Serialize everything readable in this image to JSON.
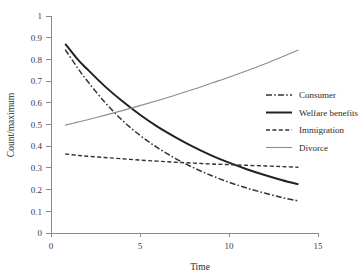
{
  "chart_data": {
    "type": "line",
    "title": "",
    "xlabel": "Time",
    "ylabel": "Count/maximum",
    "xlim": [
      0,
      15
    ],
    "ylim": [
      0,
      1
    ],
    "xticks": [
      "0",
      "5",
      "10",
      "15"
    ],
    "xtick_values": [
      0,
      5,
      10,
      15
    ],
    "yticks": [
      "0",
      "0.1",
      "0.2",
      "0.3",
      "0.4",
      "0.5",
      "0.6",
      "0.7",
      "0.8",
      "0.9",
      "1"
    ],
    "ytick_values": [
      0,
      0.1,
      0.2,
      0.3,
      0.4,
      0.5,
      0.6,
      0.7,
      0.8,
      0.9,
      1
    ],
    "grid": false,
    "legend_position": "right-upper",
    "x": [
      0.8,
      1.5,
      2,
      3,
      4,
      5,
      6,
      7,
      8,
      9,
      10,
      11,
      12,
      13,
      13.9
    ],
    "series": [
      {
        "name": "Consumer",
        "style": "dash-dot",
        "color": "#333333",
        "values": [
          0.845,
          0.76,
          0.705,
          0.605,
          0.52,
          0.45,
          0.392,
          0.343,
          0.301,
          0.265,
          0.234,
          0.207,
          0.184,
          0.163,
          0.148
        ]
      },
      {
        "name": "Welfare benefits",
        "style": "solid-thick",
        "color": "#222222",
        "values": [
          0.872,
          0.8,
          0.758,
          0.678,
          0.608,
          0.545,
          0.489,
          0.441,
          0.397,
          0.358,
          0.324,
          0.294,
          0.267,
          0.243,
          0.224
        ]
      },
      {
        "name": "Immigration",
        "style": "dashed",
        "color": "#333333",
        "values": [
          0.364,
          0.358,
          0.354,
          0.348,
          0.342,
          0.336,
          0.331,
          0.326,
          0.322,
          0.318,
          0.315,
          0.312,
          0.309,
          0.306,
          0.303
        ]
      },
      {
        "name": "Divorce",
        "style": "solid-thin",
        "color": "#8c8c8c",
        "values": [
          0.497,
          0.511,
          0.521,
          0.542,
          0.564,
          0.587,
          0.611,
          0.636,
          0.662,
          0.69,
          0.718,
          0.748,
          0.779,
          0.812,
          0.843
        ]
      }
    ],
    "legend": [
      {
        "label": "Consumer",
        "style": "dash-dot",
        "color": "#333333"
      },
      {
        "label": "Welfare benefits",
        "style": "solid-thick",
        "color": "#222222"
      },
      {
        "label": "Immigration",
        "style": "dashed",
        "color": "#333333"
      },
      {
        "label": "Divorce",
        "style": "solid-thin",
        "color": "#8c8c8c"
      }
    ]
  }
}
